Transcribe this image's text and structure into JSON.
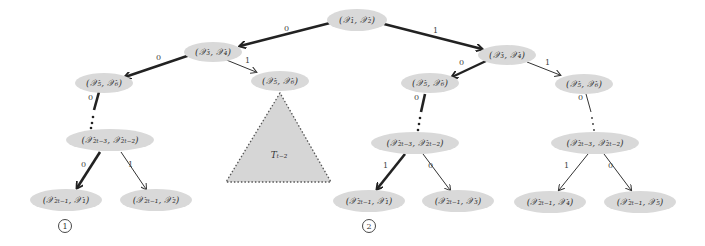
{
  "colors": {
    "node_fill": "#d9d9d9",
    "edge": "#222222",
    "triangle_fill": "#d6d6d6",
    "background": "#ffffff"
  },
  "nodes": {
    "root": "(𝒳₁, 𝒳₂)",
    "l1": "(𝒳₃, 𝒳₄)",
    "r1": "(𝒳₃, 𝒳₄)",
    "l2a": "(𝒳₅, 𝒳₆)",
    "l2b": "(𝒳₅, 𝒳₆)",
    "r2a": "(𝒳₅, 𝒳₆)",
    "r2b": "(𝒳₅, 𝒳₆)",
    "l3": "(𝒳₂ₜ₋₃, 𝒳₂ₜ₋₂)",
    "r3a": "(𝒳₂ₜ₋₃, 𝒳₂ₜ₋₂)",
    "r3b": "(𝒳₂ₜ₋₃, 𝒳₂ₜ₋₂)",
    "leaf1": "(𝒳₂ₜ₋₁, 𝒳₁)",
    "leaf2": "(𝒳₂ₜ₋₁, 𝒳₂)",
    "leaf3": "(𝒳₂ₜ₋₁, 𝒳₁)",
    "leaf4": "(𝒳₂ₜ₋₁, 𝒳₃)",
    "leaf5": "(𝒳₂ₜ₋₁, 𝒳₄)",
    "leaf6": "(𝒳₂ₜ₋₁, 𝒳₅)"
  },
  "edge_labels": {
    "root_l1": "0",
    "root_r1": "1",
    "l1_l2a": "0",
    "l1_l2b": "1",
    "r1_r2a": "0",
    "r1_r2b": "1",
    "l2a_l3": "0",
    "r2a_r3a": "0",
    "r2b_r3b": "0",
    "l3_leaf1": "0",
    "l3_leaf2": "1",
    "r3a_leaf3": "1",
    "r3a_leaf4": "0",
    "r3b_leaf5": "1",
    "r3b_leaf6": "0"
  },
  "subtree": {
    "label": "Tₜ₋₂"
  },
  "markers": {
    "m1": "1",
    "m2": "2"
  }
}
